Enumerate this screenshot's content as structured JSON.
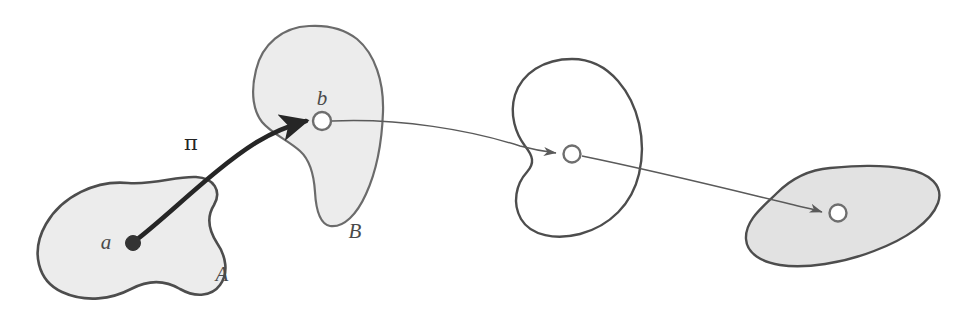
{
  "figure": {
    "background_color": "#ffffff",
    "width": 964,
    "height": 320,
    "colors": {
      "blob_outline": "#4d4d4d",
      "blob_fill_light": "#ececec",
      "blob_fill_none": "#ffffff",
      "blob_fill_dark": "#e2e2e2",
      "thick_arrow": "#262626",
      "thin_arrow": "#5a5a5a",
      "label_color": "#4a4a4a",
      "point_filled": "#333333",
      "point_hollow_stroke": "#6e6e6e",
      "point_hollow_fill": "#ffffff"
    },
    "labels": {
      "set_a": "A",
      "set_b": "B",
      "point_a": "a",
      "point_b": "b",
      "map_pi": "π"
    },
    "blobs": [
      {
        "id": "blob-a",
        "label": "A",
        "fill": "#ececec",
        "outline": "#4d4d4d",
        "stroke_width": 2.6,
        "label_x": 222,
        "label_y": 281,
        "path": "M 128 183 C 96 180 62 196 46 224 C 30 252 38 281 62 292 C 86 303 112 299 131 289 C 148 280 165 280 180 289 C 196 298 212 296 220 285 C 229 273 226 256 217 243 C 208 229 207 216 214 205 C 222 191 214 178 196 177 C 176 176 155 185 128 183 Z"
      },
      {
        "id": "blob-b",
        "label": "B",
        "fill": "#ececec",
        "outline": "#6b6b6b",
        "stroke_width": 2.2,
        "label_x": 355,
        "label_y": 238,
        "path": "M 309 26 C 283 27 262 44 256 70 C 250 94 254 112 262 122 C 272 134 288 140 300 151 C 310 160 314 176 315 192 C 316 210 320 224 330 226 C 344 228 357 214 366 194 C 377 170 382 140 383 112 C 384 82 375 54 357 39 C 343 28 326 25 309 26 Z"
      },
      {
        "id": "blob-c",
        "label": "",
        "fill": "#ffffff",
        "outline": "#4d4d4d",
        "stroke_width": 2.4,
        "label_x": null,
        "label_y": null,
        "path": "M 572 59 C 544 59 522 73 515 95 C 509 115 516 134 525 146 C 533 156 535 163 527 172 C 516 184 512 203 521 219 C 531 236 556 240 580 234 C 610 226 632 204 639 174 C 647 140 638 104 618 81 C 605 66 589 59 572 59 Z"
      },
      {
        "id": "blob-d",
        "label": "",
        "fill": "#e2e2e2",
        "outline": "#4d4d4d",
        "stroke_width": 2.4,
        "label_x": null,
        "label_y": null,
        "path": "M 830 168 C 806 170 789 181 777 193 C 763 207 745 220 746 239 C 747 254 762 262 780 265 C 806 269 843 263 874 251 C 906 239 931 222 938 203 C 944 186 930 173 906 169 C 880 164 854 166 830 168 Z"
      }
    ],
    "points": [
      {
        "id": "point-a",
        "label": "a",
        "style": "filled",
        "cx": 133,
        "cy": 243,
        "r": 7.5,
        "label_x": 106,
        "label_y": 249
      },
      {
        "id": "point-b",
        "label": "b",
        "style": "hollow",
        "cx": 322,
        "cy": 121,
        "r": 9,
        "label_x": 322,
        "label_y": 105
      },
      {
        "id": "point-c",
        "label": "",
        "style": "hollow",
        "cx": 572,
        "cy": 154,
        "r": 8.5,
        "label_x": null,
        "label_y": null
      },
      {
        "id": "point-d",
        "label": "",
        "style": "hollow",
        "cx": 838,
        "cy": 213,
        "r": 8.5,
        "label_x": null,
        "label_y": null
      }
    ],
    "arrows": [
      {
        "id": "arrow-pi",
        "label": "π",
        "kind": "thick",
        "from_point": "point-a",
        "to_point": "point-b",
        "color": "#262626",
        "stroke_width": 4.6,
        "label_x": 191,
        "label_y": 150,
        "path": "M 135 241 C 168 216 215 168 257 142 C 277 130 295 124 306 121"
      },
      {
        "id": "arrow-b-to-c",
        "label": "",
        "kind": "thin",
        "from_point": "point-b",
        "to_point": "point-c",
        "color": "#5a5a5a",
        "stroke_width": 1.5,
        "label_x": null,
        "label_y": null,
        "path": "M 332 121 C 400 118 470 130 520 146 C 535 150 548 152 556 153"
      },
      {
        "id": "arrow-c-to-d",
        "label": "",
        "kind": "thin",
        "from_point": "point-c",
        "to_point": "point-d",
        "color": "#5a5a5a",
        "stroke_width": 1.5,
        "label_x": null,
        "label_y": null,
        "path": "M 582 156 C 660 172 740 192 790 204 C 806 208 816 210 822 212"
      }
    ]
  }
}
